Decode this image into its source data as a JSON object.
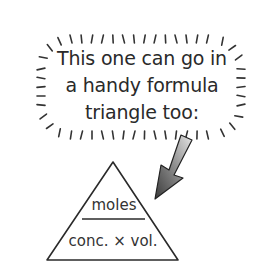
{
  "bubble": {
    "lines": [
      "This one can go in",
      "a handy formula",
      "triangle too:"
    ]
  },
  "formula_triangle": {
    "top": "moles",
    "bottom": "conc. × vol."
  },
  "colors": {
    "ink": "#2a2a2a",
    "arrow_dark": "#3a3a3a",
    "arrow_light": "#d8d8d8"
  }
}
